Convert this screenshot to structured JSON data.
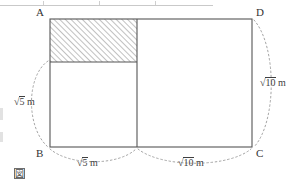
{
  "figure": {
    "caption_mark": "図",
    "vertices": [
      {
        "id": "A",
        "label": "A",
        "x": 50,
        "y": 19,
        "label_x": 36,
        "label_y": 7
      },
      {
        "id": "B",
        "label": "B",
        "x": 50,
        "y": 147,
        "label_x": 36,
        "label_y": 148
      },
      {
        "id": "C",
        "label": "C",
        "x": 252,
        "y": 147,
        "label_x": 256,
        "label_y": 148
      },
      {
        "id": "D",
        "label": "D",
        "x": 252,
        "y": 19,
        "label_x": 256,
        "label_y": 7
      }
    ],
    "outer_rectangle": {
      "x": 50,
      "y": 19,
      "width": 202,
      "height": 128
    },
    "divider_line": {
      "x": 137,
      "y1": 19,
      "y2": 147
    },
    "hatched_region": {
      "x": 50,
      "y": 19,
      "width": 87,
      "height": 43,
      "hatch_angle_deg": 45,
      "hatch_spacing_px": 4
    },
    "measurements": [
      {
        "id": "left-height",
        "radicand": "5",
        "unit": "m",
        "label_x": 13,
        "label_y": 96,
        "arc": "left"
      },
      {
        "id": "bottom-left-width",
        "radicand": "5",
        "unit": "m",
        "label_x": 76,
        "label_y": 157,
        "arc": "bottom-left"
      },
      {
        "id": "bottom-right-width",
        "radicand": "10",
        "unit": "m",
        "label_x": 177,
        "label_y": 157,
        "arc": "bottom-right"
      },
      {
        "id": "right-height",
        "radicand": "10",
        "unit": "m",
        "label_x": 259,
        "label_y": 77,
        "arc": "right"
      }
    ],
    "colors": {
      "stroke": "#555555",
      "hatch": "#8c8c8c",
      "dashed_arc": "#9a9a9a",
      "text": "#333333",
      "ruler": "#c9c9c9",
      "background": "#ffffff"
    },
    "radical_symbol": "√"
  }
}
